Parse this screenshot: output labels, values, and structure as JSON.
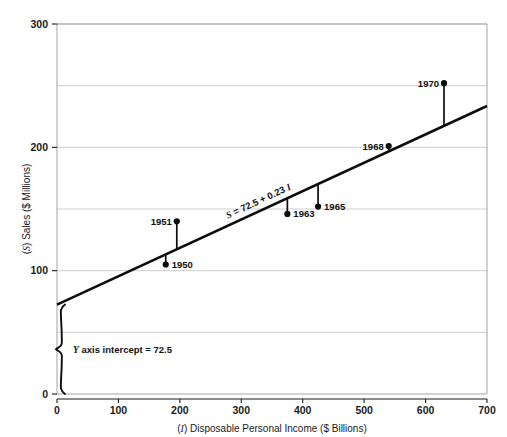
{
  "chart_data": {
    "type": "scatter",
    "title": "",
    "xlabel": "(I) Disposable Personal Income ($ Billions)",
    "ylabel": "(S) Sales ($ Millions)",
    "xlabel_symbol": "I",
    "xlabel_rest": ") Disposable Personal Income ($ Billions)",
    "xlabel_open": "(",
    "ylabel_symbol": "S",
    "ylabel_open": "(",
    "ylabel_rest": ") Sales ($ Millions)",
    "xlim": [
      0,
      700
    ],
    "ylim": [
      0,
      300
    ],
    "x_ticks": [
      0,
      100,
      200,
      300,
      400,
      500,
      600,
      700
    ],
    "y_ticks": [
      0,
      100,
      200,
      300
    ],
    "y_gridlines": [
      50,
      100,
      150,
      200,
      250,
      300
    ],
    "grid": "horizontal",
    "legend": "none",
    "points": [
      {
        "label": "1950",
        "x": 177,
        "y": 105,
        "label_pos": "right"
      },
      {
        "label": "1951",
        "x": 195,
        "y": 140,
        "label_pos": "left"
      },
      {
        "label": "1963",
        "x": 375,
        "y": 146,
        "label_pos": "right"
      },
      {
        "label": "1965",
        "x": 425,
        "y": 152,
        "label_pos": "right"
      },
      {
        "label": "1968",
        "x": 540,
        "y": 201,
        "label_pos": "left"
      },
      {
        "label": "1970",
        "x": 630,
        "y": 252,
        "label_pos": "left"
      }
    ],
    "fit_line": {
      "intercept": 72.5,
      "slope": 0.23,
      "equation": "S = 72.5 + 0.23 I",
      "equation_lead": " = 72.5 + 0.23 ",
      "equation_sym_start": "S",
      "equation_sym_end": "I"
    },
    "annotations": [
      {
        "name": "y-intercept-brace",
        "text": "Y axis intercept = 72.5",
        "text_symbol": "Y",
        "text_rest": " axis intercept = 72.5",
        "value": 72.5
      }
    ],
    "colors": {
      "line": "#0d0d0d",
      "point": "#0d0d0d",
      "grid": "#b9b9b9",
      "frame": "#9a9a9a",
      "background": "#ffffff"
    }
  }
}
